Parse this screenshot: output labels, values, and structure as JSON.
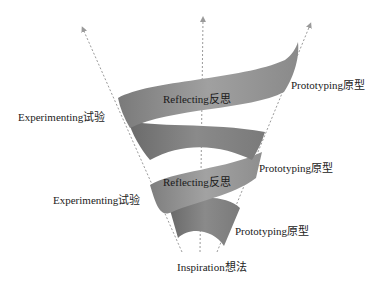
{
  "diagram": {
    "type": "spiral-funnel",
    "colors": {
      "band_dark": "#6e6e6e",
      "band_mid": "#8c8c8c",
      "band_light": "#a6a6a6",
      "arrow": "#9a9a9a",
      "text": "#222222"
    },
    "labels": {
      "experimenting_top": "Experimenting试验",
      "reflecting_top": "Reflecting反思",
      "prototyping_top": "Prototyping原型",
      "prototyping_mid": "Prototyping原型",
      "experimenting_bottom": "Experimenting试验",
      "reflecting_bottom": "Reflecting反思",
      "prototyping_bottom": "Prototyping原型",
      "inspiration": "Inspiration想法"
    },
    "axes": [
      {
        "name": "left-axis",
        "from": [
          182,
          252
        ],
        "to": [
          82,
          27
        ]
      },
      {
        "name": "center-axis",
        "from": [
          200,
          252
        ],
        "to": [
          203,
          17
        ]
      },
      {
        "name": "right-axis",
        "from": [
          217,
          252
        ],
        "to": [
          311,
          23
        ]
      }
    ]
  }
}
